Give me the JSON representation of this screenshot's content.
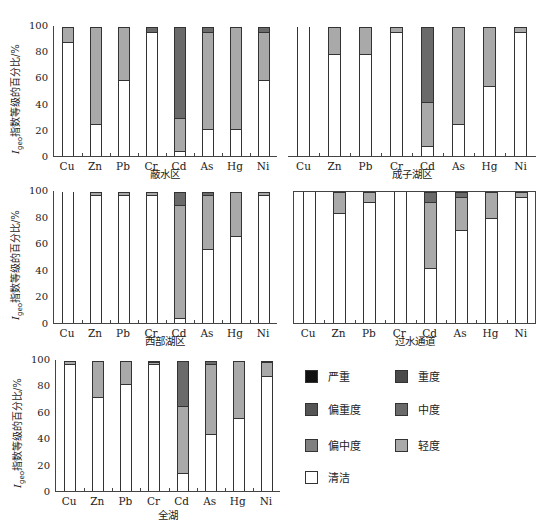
{
  "figure": {
    "y_axis_label_prefix": "I",
    "y_axis_label_sub": "geo",
    "y_axis_label_rest": "指数等级的百分比/%",
    "y_ticks": [
      "100",
      "80",
      "60",
      "40",
      "20",
      "0"
    ]
  },
  "legend": {
    "items": [
      {
        "key": "yanzhong",
        "label": "严重",
        "color": "#111111"
      },
      {
        "key": "zhongdu",
        "label": "重度",
        "color": "#4a4a4a"
      },
      {
        "key": "pianzhongdu",
        "label": "偏重度",
        "color": "#555555"
      },
      {
        "key": "zhongdu2",
        "label": "中度",
        "color": "#6a6a6a"
      },
      {
        "key": "pianzhongdu2",
        "label": "偏中度",
        "color": "#808080"
      },
      {
        "key": "qingdu",
        "label": "轻度",
        "color": "#a9a9a9"
      },
      {
        "key": "qingjie",
        "label": "清洁",
        "color": "#ffffff"
      }
    ]
  },
  "chart_data": [
    {
      "type": "bar",
      "stacked": true,
      "title": "蔽水区",
      "xlabel": "",
      "ylabel": "Igeo指数等级的百分比/%",
      "ylim": [
        0,
        100
      ],
      "categories": [
        "Cu",
        "Zn",
        "Pb",
        "Cr",
        "Cd",
        "As",
        "Hg",
        "Ni"
      ],
      "series": [
        {
          "name": "清洁",
          "values": [
            88,
            25,
            59,
            96,
            4,
            21,
            21,
            59
          ]
        },
        {
          "name": "轻度",
          "values": [
            12,
            75,
            41,
            0,
            25,
            75,
            79,
            37
          ]
        },
        {
          "name": "偏中度",
          "values": [
            0,
            0,
            0,
            0,
            0,
            0,
            0,
            0
          ]
        },
        {
          "name": "中度",
          "values": [
            0,
            0,
            0,
            4,
            71,
            4,
            0,
            4
          ]
        },
        {
          "name": "偏重度",
          "values": [
            0,
            0,
            0,
            0,
            0,
            0,
            0,
            0
          ]
        },
        {
          "name": "重度",
          "values": [
            0,
            0,
            0,
            0,
            0,
            0,
            0,
            0
          ]
        },
        {
          "name": "严重",
          "values": [
            0,
            0,
            0,
            0,
            0,
            0,
            0,
            0
          ]
        }
      ]
    },
    {
      "type": "bar",
      "stacked": true,
      "title": "成子湖区",
      "ylim": [
        0,
        100
      ],
      "categories": [
        "Cu",
        "Zn",
        "Pb",
        "Cr",
        "Cd",
        "As",
        "Hg",
        "Ni"
      ],
      "series": [
        {
          "name": "清洁",
          "values": [
            100,
            79,
            79,
            96,
            8,
            25,
            54,
            96
          ]
        },
        {
          "name": "轻度",
          "values": [
            0,
            21,
            21,
            4,
            34,
            75,
            46,
            4
          ]
        },
        {
          "name": "中度",
          "values": [
            0,
            0,
            0,
            0,
            58,
            0,
            0,
            0
          ]
        }
      ]
    },
    {
      "type": "bar",
      "stacked": true,
      "title": "西部湖区",
      "ylim": [
        0,
        100
      ],
      "categories": [
        "Cu",
        "Zn",
        "Pb",
        "Cr",
        "Cd",
        "As",
        "Hg",
        "Ni"
      ],
      "series": [
        {
          "name": "清洁",
          "values": [
            100,
            97,
            97,
            97,
            4,
            56,
            66,
            97
          ]
        },
        {
          "name": "轻度",
          "values": [
            0,
            3,
            3,
            3,
            86,
            41,
            34,
            3
          ]
        },
        {
          "name": "中度",
          "values": [
            0,
            0,
            0,
            0,
            10,
            3,
            0,
            0
          ]
        }
      ]
    },
    {
      "type": "bar",
      "stacked": true,
      "title": "过水通道",
      "ylim": [
        0,
        100
      ],
      "categories": [
        "Cu",
        "Zn",
        "Pb",
        "Cr",
        "Cd",
        "As",
        "Hg",
        "Ni"
      ],
      "series": [
        {
          "name": "清洁",
          "values": [
            100,
            84,
            92,
            100,
            42,
            71,
            80,
            96
          ]
        },
        {
          "name": "轻度",
          "values": [
            0,
            16,
            8,
            0,
            50,
            25,
            20,
            4
          ]
        },
        {
          "name": "中度",
          "values": [
            0,
            0,
            0,
            0,
            8,
            4,
            0,
            0
          ]
        }
      ]
    },
    {
      "type": "bar",
      "stacked": true,
      "title": "全湖",
      "ylim": [
        0,
        100
      ],
      "categories": [
        "Cu",
        "Zn",
        "Pb",
        "Cr",
        "Cd",
        "As",
        "Hg",
        "Ni"
      ],
      "series": [
        {
          "name": "清洁",
          "values": [
            97,
            72,
            82,
            97,
            14,
            44,
            56,
            88
          ]
        },
        {
          "name": "轻度",
          "values": [
            3,
            28,
            18,
            2,
            51,
            53,
            44,
            11
          ]
        },
        {
          "name": "中度",
          "values": [
            0,
            0,
            0,
            1,
            35,
            3,
            0,
            1
          ]
        }
      ]
    }
  ]
}
